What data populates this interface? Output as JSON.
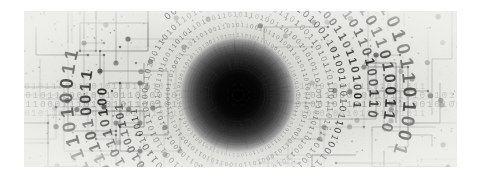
{
  "image": {
    "title": "Binary code vortex over circuit board background",
    "alt_text": "Abstract grayscale technology image: concentric rings of binary digits spiralling into a dark circular tunnel, overlaid on a printed circuit board trace pattern",
    "subject": "binary-vortex",
    "style": "grayscale abstract technology illustration",
    "canvas": {
      "page_width": 481,
      "page_height": 179,
      "frame_x": 24,
      "frame_y": 11,
      "frame_width": 433,
      "frame_height": 156,
      "page_background": "#ffffff"
    },
    "palette": {
      "page_background": "#ffffff",
      "paper": "#dededa",
      "paper_light": "#eaeae6",
      "paper_mid": "#d2d2ce",
      "trace": "#5a5a5a",
      "trace_light": "#8d8d8d",
      "node": "#3c3c3c",
      "digit_dark": "#2b2b2b",
      "digit_mid": "#6e6e6e",
      "digit_faint": "#a9a9a9",
      "core": "#050505",
      "vortex_mid": "#4a4a4a",
      "vortex_outer": "#9b9b9b"
    },
    "vortex": {
      "center_x": 214,
      "center_y": 84,
      "core_radius": 26,
      "glow_radius": 64,
      "ring_count": 13,
      "ring_radii": [
        30,
        36,
        43,
        51,
        60,
        70,
        81,
        93,
        106,
        120,
        136,
        153,
        172
      ],
      "ring_font_sizes": [
        3.0,
        3.4,
        3.9,
        4.5,
        5.2,
        6.0,
        7.0,
        8.2,
        9.6,
        11.3,
        13.4,
        15.8,
        18.6
      ],
      "ring_opacities": [
        0.42,
        0.5,
        0.58,
        0.66,
        0.74,
        0.8,
        0.84,
        0.88,
        0.9,
        0.92,
        0.94,
        0.95,
        0.96
      ]
    },
    "binary_rings": [
      "1011010011010110101101001101",
      "0110100110101101001101011010",
      "1101011010011010110100110101",
      "0011010110100110101101001101",
      "1010110100110101101001101011",
      "0101101001101011010011010110",
      "1101001101011010011010110100",
      "0110101101001101011010011010",
      "1001101011010011010110100110",
      "0101101001101011010011011010",
      "1101011010011010110100110100",
      "0110100110101101001101011011",
      "1010011010110100110101101001"
    ],
    "binary_strips": [
      {
        "text": "0010110001001011010010110010100101101001011000100101101001011",
        "y": 78,
        "size": 8.5,
        "opacity": 0.3
      },
      {
        "text": "00101100010010110100101100101001011010010110001001011010010110",
        "y": 87,
        "size": 9.5,
        "opacity": 0.45
      },
      {
        "text": "01100011101001011001010010110100101100010010110100101100101001",
        "y": 96,
        "size": 9.5,
        "opacity": 0.5
      },
      {
        "text": "0010110001001011010010110010100101101001011000100101101001011",
        "y": 105,
        "size": 8.5,
        "opacity": 0.28
      }
    ],
    "circuit": {
      "description": "printed circuit board traces with junction pads",
      "trace_width": 0.9,
      "large_node_radius": 2.6,
      "small_node_radius": 0.8,
      "node_count": 84
    },
    "grain": {
      "description": "paper grain / halftone speckle texture",
      "density": "medium"
    }
  }
}
